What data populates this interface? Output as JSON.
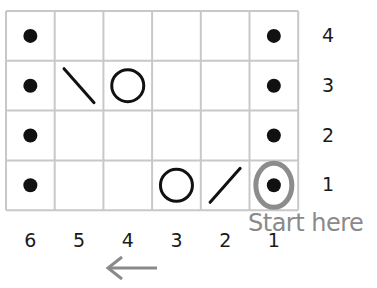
{
  "chart": {
    "columns": 6,
    "rows": 4,
    "column_labels": [
      "6",
      "5",
      "4",
      "3",
      "2",
      "1"
    ],
    "row_labels": [
      "4",
      "3",
      "2",
      "1"
    ],
    "cells": [
      [
        "purl",
        "",
        "",
        "",
        "",
        "purl"
      ],
      [
        "purl",
        "k2tog-left",
        "yarn-over",
        "",
        "",
        "purl"
      ],
      [
        "purl",
        "",
        "",
        "",
        "",
        "purl"
      ],
      [
        "purl",
        "",
        "",
        "yarn-over",
        "k2tog-right",
        "purl"
      ]
    ],
    "start_label": "Start here",
    "start_cell": {
      "row": 1,
      "col": 1
    },
    "direction_arrow": "left",
    "colors": {
      "grid": "#c8c8c8",
      "symbol": "#111111",
      "highlight": "#8c8c8c"
    }
  }
}
